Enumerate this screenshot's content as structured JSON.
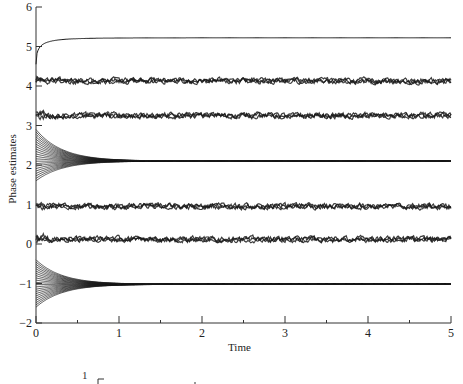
{
  "chart_data": [
    {
      "type": "line",
      "title": "",
      "xlabel": "Time",
      "ylabel": "Phase estimates",
      "xlim": [
        0,
        5
      ],
      "ylim": [
        -2,
        6
      ],
      "x_ticks": [
        "0",
        "1",
        "2",
        "3",
        "4",
        "5"
      ],
      "x_minor_ticks": [
        0.5,
        1.5,
        2.5,
        3.5,
        4.5
      ],
      "y_ticks": [
        "-2",
        "-1",
        "0",
        "1",
        "2",
        "3",
        "4",
        "5",
        "6"
      ],
      "grid": false,
      "legend": null,
      "series": [
        {
          "name": "converging-top",
          "kind": "rising",
          "start": 4.55,
          "final": 5.22,
          "rate": 2.2
        },
        {
          "name": "noisy-band-4",
          "kind": "noisy",
          "level": 4.13,
          "amplitude": 0.05
        },
        {
          "name": "noisy-band-3",
          "kind": "noisy",
          "level": 3.25,
          "amplitude": 0.05
        },
        {
          "name": "bundle-2",
          "kind": "bundle",
          "final": 2.1,
          "start_min": 1.6,
          "start_max": 2.9,
          "count": 22,
          "rate": 3.2
        },
        {
          "name": "noisy-band-1",
          "kind": "noisy",
          "level": 0.95,
          "amplitude": 0.05
        },
        {
          "name": "noisy-band-0",
          "kind": "noisy",
          "level": 0.12,
          "amplitude": 0.05
        },
        {
          "name": "bundle-neg1",
          "kind": "bundle",
          "final": -1.02,
          "start_min": -1.6,
          "start_max": -0.4,
          "count": 22,
          "rate": 3.2
        }
      ]
    },
    {
      "type": "line",
      "note": "second panel partially visible at bottom edge",
      "y_ticks": [
        "1"
      ]
    }
  ],
  "labels": {
    "xlabel": "Time",
    "ylabel": "Phase estimates",
    "partial_y_tick": "1"
  },
  "colors": {
    "line": "#1a1a1a",
    "axis": "#333333",
    "background": "#ffffff"
  }
}
